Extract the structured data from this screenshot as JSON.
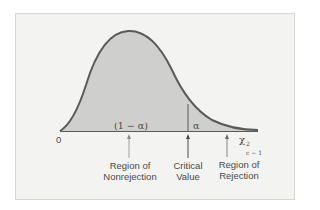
{
  "diagram": {
    "axis": {
      "origin_label": "0",
      "x_symbol": "χ",
      "x_superscript": "2",
      "x_subscript": "c − 1"
    },
    "areas": {
      "nonrejection_area": "(1 − α)",
      "rejection_area": "α"
    },
    "annotations": {
      "nonrejection_line1": "Region of",
      "nonrejection_line2": "Nonrejection",
      "critical_line1": "Critical",
      "critical_line2": "Value",
      "rejection_line1": "Region of",
      "rejection_line2": "Rejection"
    },
    "colors": {
      "background": "#f3f3f1",
      "fill": "#cfcfcd",
      "curve": "#5a5a5a",
      "text": "#4a4a4a"
    }
  }
}
